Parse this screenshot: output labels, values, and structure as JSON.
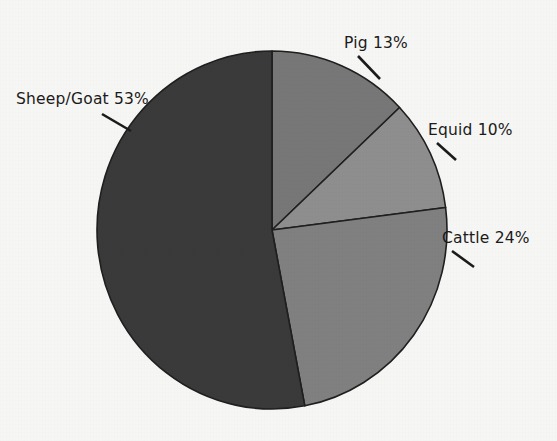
{
  "background_color": "#f6f6f4",
  "outline_color": "#1f1f1f",
  "text_color": "#1b1b1b",
  "chart_data": {
    "type": "pie",
    "title": "",
    "subtitle": "",
    "xlabel": "",
    "ylabel": "",
    "grid": false,
    "legend_position": "none",
    "label_format": "{name} {value}%",
    "start_angle_deg": 90,
    "direction": "clockwise",
    "categories": [
      "Pig",
      "Equid",
      "Cattle",
      "Sheep/Goat"
    ],
    "values": [
      13,
      10,
      24,
      53
    ],
    "colors": [
      "#777777",
      "#8e8e8e",
      "#808080",
      "#3a3a3a"
    ],
    "slices": [
      {
        "name": "Pig",
        "value": 13,
        "label": "Pig 13%",
        "color": "#777777",
        "label_x": 344,
        "label_y": 48,
        "leader_x1": 358,
        "leader_y1": 56,
        "leader_x2": 380,
        "leader_y2": 79
      },
      {
        "name": "Equid",
        "value": 10,
        "label": "Equid 10%",
        "color": "#8e8e8e",
        "label_x": 428,
        "label_y": 135,
        "leader_x1": 437,
        "leader_y1": 143,
        "leader_x2": 456,
        "leader_y2": 160
      },
      {
        "name": "Cattle",
        "value": 24,
        "label": "Cattle 24%",
        "color": "#808080",
        "label_x": 442,
        "label_y": 243,
        "leader_x1": 452,
        "leader_y1": 251,
        "leader_x2": 474,
        "leader_y2": 267
      },
      {
        "name": "Sheep/Goat",
        "value": 53,
        "label": "Sheep/Goat 53%",
        "color": "#3a3a3a",
        "label_x": 16,
        "label_y": 104,
        "leader_x1": 102,
        "leader_y1": 114,
        "leader_x2": 131,
        "leader_y2": 131
      }
    ],
    "geometry": {
      "center_x": 272,
      "center_y": 230,
      "radius_x": 175,
      "radius_y": 179
    }
  }
}
